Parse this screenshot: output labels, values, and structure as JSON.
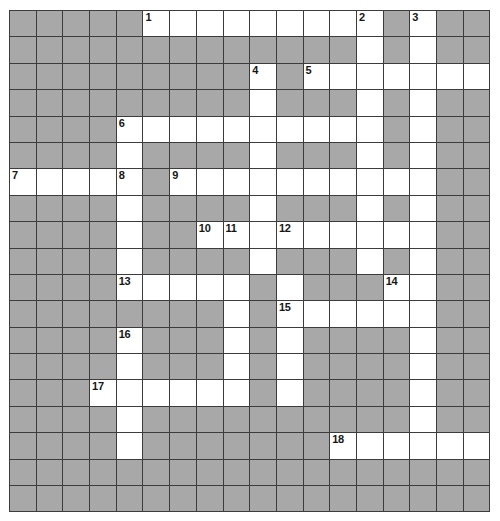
{
  "puzzle": {
    "type": "crossword-grid",
    "title": "Crossword Puzzle Grid",
    "columns": 18,
    "rows": 19,
    "cell_size_px": 26.7,
    "colors": {
      "block": "#a8a8a8",
      "open": "#ffffff",
      "grid_line": "#3c3c3c",
      "number_text": "#161616",
      "page_background": "#ffffff"
    },
    "legend": {
      "block_meaning": "blocked-cell",
      "open_meaning": "letter-cell"
    },
    "clue_numbers": [
      1,
      2,
      3,
      4,
      5,
      6,
      7,
      8,
      9,
      10,
      11,
      12,
      13,
      14,
      15,
      16,
      17,
      18
    ],
    "numbered_cells": [
      {
        "number": 1,
        "row": 0,
        "col": 5
      },
      {
        "number": 2,
        "row": 0,
        "col": 13
      },
      {
        "number": 3,
        "row": 0,
        "col": 15
      },
      {
        "number": 4,
        "row": 2,
        "col": 9
      },
      {
        "number": 5,
        "row": 2,
        "col": 11
      },
      {
        "number": 6,
        "row": 4,
        "col": 4
      },
      {
        "number": 7,
        "row": 6,
        "col": 0
      },
      {
        "number": 8,
        "row": 6,
        "col": 4
      },
      {
        "number": 9,
        "row": 6,
        "col": 6
      },
      {
        "number": 10,
        "row": 8,
        "col": 7
      },
      {
        "number": 11,
        "row": 8,
        "col": 8
      },
      {
        "number": 12,
        "row": 8,
        "col": 10
      },
      {
        "number": 13,
        "row": 10,
        "col": 4
      },
      {
        "number": 14,
        "row": 10,
        "col": 14
      },
      {
        "number": 15,
        "row": 11,
        "col": 10
      },
      {
        "number": 16,
        "row": 12,
        "col": 4
      },
      {
        "number": 17,
        "row": 14,
        "col": 3
      },
      {
        "number": 18,
        "row": 16,
        "col": 12
      }
    ],
    "grid": [
      [
        0,
        0,
        0,
        0,
        0,
        1,
        1,
        1,
        1,
        1,
        1,
        1,
        1,
        1,
        0,
        1,
        0,
        0
      ],
      [
        0,
        0,
        0,
        0,
        0,
        0,
        0,
        0,
        0,
        0,
        0,
        0,
        0,
        1,
        0,
        1,
        0,
        0
      ],
      [
        0,
        0,
        0,
        0,
        0,
        0,
        0,
        0,
        0,
        1,
        0,
        1,
        1,
        1,
        1,
        1,
        1,
        1
      ],
      [
        0,
        0,
        0,
        0,
        0,
        0,
        0,
        0,
        0,
        1,
        0,
        0,
        0,
        1,
        0,
        1,
        0,
        0
      ],
      [
        0,
        0,
        0,
        0,
        1,
        1,
        1,
        1,
        1,
        1,
        1,
        1,
        1,
        1,
        0,
        1,
        0,
        0
      ],
      [
        0,
        0,
        0,
        0,
        1,
        0,
        0,
        0,
        0,
        1,
        0,
        0,
        0,
        1,
        0,
        1,
        0,
        0
      ],
      [
        1,
        1,
        1,
        1,
        1,
        0,
        1,
        1,
        1,
        1,
        1,
        1,
        1,
        1,
        1,
        1,
        0,
        0
      ],
      [
        0,
        0,
        0,
        0,
        1,
        0,
        0,
        0,
        0,
        1,
        0,
        0,
        0,
        1,
        0,
        1,
        0,
        0
      ],
      [
        0,
        0,
        0,
        0,
        1,
        0,
        0,
        1,
        1,
        1,
        1,
        1,
        1,
        1,
        1,
        1,
        0,
        0
      ],
      [
        0,
        0,
        0,
        0,
        1,
        0,
        0,
        0,
        0,
        1,
        0,
        0,
        0,
        1,
        0,
        1,
        0,
        0
      ],
      [
        0,
        0,
        0,
        0,
        1,
        1,
        1,
        1,
        1,
        0,
        1,
        0,
        0,
        0,
        1,
        1,
        0,
        0
      ],
      [
        0,
        0,
        0,
        0,
        0,
        0,
        0,
        0,
        1,
        0,
        1,
        1,
        1,
        1,
        1,
        1,
        0,
        0
      ],
      [
        0,
        0,
        0,
        0,
        1,
        0,
        0,
        0,
        1,
        0,
        1,
        0,
        0,
        0,
        0,
        1,
        0,
        0
      ],
      [
        0,
        0,
        0,
        0,
        1,
        0,
        0,
        0,
        1,
        0,
        1,
        0,
        0,
        0,
        0,
        1,
        0,
        0
      ],
      [
        0,
        0,
        0,
        1,
        1,
        1,
        1,
        1,
        1,
        0,
        1,
        0,
        0,
        0,
        0,
        1,
        0,
        0
      ],
      [
        0,
        0,
        0,
        0,
        1,
        0,
        0,
        0,
        0,
        0,
        0,
        0,
        0,
        0,
        0,
        1,
        0,
        0
      ],
      [
        0,
        0,
        0,
        0,
        1,
        0,
        0,
        0,
        0,
        0,
        0,
        0,
        1,
        1,
        1,
        1,
        1,
        1
      ],
      [
        0,
        0,
        0,
        0,
        0,
        0,
        0,
        0,
        0,
        0,
        0,
        0,
        0,
        0,
        0,
        0,
        0,
        0
      ],
      [
        0,
        0,
        0,
        0,
        0,
        0,
        0,
        0,
        0,
        0,
        0,
        0,
        0,
        0,
        0,
        0,
        0,
        0
      ]
    ]
  }
}
